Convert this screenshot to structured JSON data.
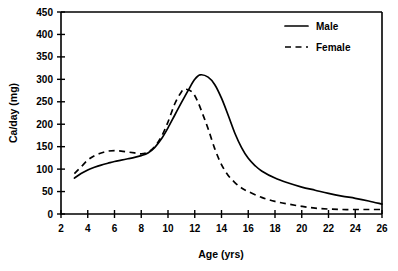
{
  "chart_data": {
    "type": "line",
    "title": "",
    "xlabel": "Age (yrs)",
    "ylabel": "Ca/day (mg)",
    "xlim": [
      2,
      26
    ],
    "ylim": [
      0,
      450
    ],
    "xticks": [
      2,
      4,
      6,
      8,
      10,
      12,
      14,
      16,
      18,
      20,
      22,
      24,
      26
    ],
    "yticks": [
      0,
      50,
      100,
      150,
      200,
      250,
      300,
      350,
      400,
      450
    ],
    "grid": false,
    "legend_position": "top-right",
    "series": [
      {
        "name": "Male",
        "style": "solid",
        "color": "#000000",
        "x": [
          3,
          3.5,
          4,
          4.5,
          5,
          5.5,
          6,
          6.5,
          7,
          7.5,
          8,
          8.5,
          9,
          9.5,
          10,
          10.5,
          11,
          11.5,
          12,
          12.4,
          13,
          13.5,
          14,
          14.5,
          15,
          15.5,
          16,
          16.5,
          17,
          18,
          19,
          20,
          21,
          22,
          23,
          24,
          25,
          26
        ],
        "y": [
          80,
          90,
          98,
          104,
          109,
          113,
          117,
          120,
          123,
          126,
          130,
          136,
          148,
          167,
          192,
          220,
          248,
          275,
          300,
          310,
          305,
          288,
          258,
          220,
          180,
          148,
          124,
          108,
          96,
          80,
          69,
          60,
          53,
          46,
          40,
          35,
          29,
          22
        ]
      },
      {
        "name": "Female",
        "style": "dashed",
        "color": "#000000",
        "x": [
          3,
          3.5,
          4,
          4.5,
          5,
          5.5,
          6,
          6.5,
          7,
          7.5,
          8,
          8.5,
          9,
          9.5,
          10,
          10.5,
          11,
          11.3,
          11.8,
          12.2,
          12.6,
          13,
          13.5,
          14,
          14.5,
          15,
          15.5,
          16,
          17,
          18,
          19,
          20,
          21,
          22,
          23,
          24,
          25,
          26
        ],
        "y": [
          90,
          105,
          120,
          130,
          136,
          140,
          141,
          140,
          138,
          136,
          134,
          138,
          150,
          172,
          205,
          245,
          272,
          278,
          272,
          252,
          222,
          190,
          145,
          110,
          86,
          70,
          58,
          50,
          37,
          28,
          22,
          17,
          13,
          11,
          10,
          10,
          10,
          10
        ]
      }
    ],
    "legend": [
      {
        "label": "Male",
        "style": "solid"
      },
      {
        "label": "Female",
        "style": "dashed"
      }
    ]
  }
}
